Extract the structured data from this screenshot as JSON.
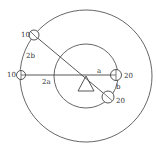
{
  "diagram": {
    "type": "rotating-disc-torque",
    "colors": {
      "stroke": "#555555",
      "text": "#333333",
      "background": "#ffffff"
    },
    "outer_circle": {
      "cx": 86,
      "cy": 76,
      "r": 66
    },
    "inner_circle": {
      "cx": 86,
      "cy": 76,
      "r": 32
    },
    "pivot": {
      "x": 86,
      "y": 76
    },
    "masses": [
      {
        "id": "upper-left",
        "label": "10",
        "x": 34,
        "y": 35
      },
      {
        "id": "left",
        "label": "10",
        "x": 21,
        "y": 75
      },
      {
        "id": "right",
        "label": "20",
        "x": 116,
        "y": 75
      },
      {
        "id": "lower-right",
        "label": "20",
        "x": 108,
        "y": 97
      }
    ],
    "distance_labels": {
      "a": "a",
      "b": "b",
      "two_a": "2a",
      "two_b": "2b"
    }
  }
}
